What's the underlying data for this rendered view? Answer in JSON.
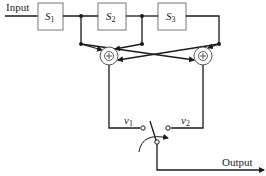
{
  "diagram": {
    "input_label": "Input",
    "output_label": "Output",
    "blocks": [
      {
        "id": "S1",
        "symbol": "S",
        "subscript": "1"
      },
      {
        "id": "S2",
        "symbol": "S",
        "subscript": "2"
      },
      {
        "id": "S3",
        "symbol": "S",
        "subscript": "3"
      }
    ],
    "summers": [
      {
        "id": "sum-left",
        "symbol": "+",
        "output": {
          "symbol": "v",
          "subscript": "1"
        }
      },
      {
        "id": "sum-right",
        "symbol": "+",
        "output": {
          "symbol": "v",
          "subscript": "2"
        }
      }
    ],
    "switch": {
      "positions": [
        "v1",
        "v2"
      ],
      "type": "selector switch"
    },
    "colors": {
      "line": "#1a1a1a",
      "box_border": "#777777"
    }
  }
}
